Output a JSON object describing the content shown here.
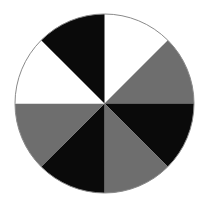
{
  "figure": {
    "background_color": "#ffffff",
    "canvas": {
      "width": 209,
      "height": 211
    }
  },
  "chart_data": {
    "type": "pie",
    "title": "",
    "subtitle": "",
    "xlabel": "",
    "ylabel": "",
    "grid": false,
    "legend_position": "none",
    "center": {
      "cx": 104.5,
      "cy": 103.5
    },
    "radius": 89.5,
    "outline_color": "#8a8a8a",
    "outline_width": 1,
    "start_angle_deg": 0,
    "direction": "clockwise",
    "slice_count": 8,
    "slice_angle_deg": 45,
    "categories": [
      "sector-1",
      "sector-2",
      "sector-3",
      "sector-4",
      "sector-5",
      "sector-6",
      "sector-7",
      "sector-8"
    ],
    "values": [
      45,
      45,
      45,
      45,
      45,
      45,
      45,
      45
    ],
    "colors": [
      "#ffffff",
      "#6e6e6e",
      "#0a0a0a",
      "#6e6e6e",
      "#0a0a0a",
      "#6e6e6e",
      "#ffffff",
      "#0a0a0a"
    ],
    "slices": [
      {
        "name": "sector-1",
        "start_deg": 0,
        "end_deg": 45,
        "value": 45,
        "color": "#ffffff",
        "clock_position": "12:00-1:30",
        "shade": "white"
      },
      {
        "name": "sector-2",
        "start_deg": 45,
        "end_deg": 90,
        "value": 45,
        "color": "#6e6e6e",
        "clock_position": "1:30-3:00",
        "shade": "gray"
      },
      {
        "name": "sector-3",
        "start_deg": 90,
        "end_deg": 135,
        "value": 45,
        "color": "#0a0a0a",
        "clock_position": "3:00-4:30",
        "shade": "black"
      },
      {
        "name": "sector-4",
        "start_deg": 135,
        "end_deg": 180,
        "value": 45,
        "color": "#6e6e6e",
        "clock_position": "4:30-6:00",
        "shade": "gray"
      },
      {
        "name": "sector-5",
        "start_deg": 180,
        "end_deg": 225,
        "value": 45,
        "color": "#0a0a0a",
        "clock_position": "6:00-7:30",
        "shade": "black"
      },
      {
        "name": "sector-6",
        "start_deg": 225,
        "end_deg": 270,
        "value": 45,
        "color": "#6e6e6e",
        "clock_position": "7:30-9:00",
        "shade": "gray"
      },
      {
        "name": "sector-7",
        "start_deg": 270,
        "end_deg": 315,
        "value": 45,
        "color": "#ffffff",
        "clock_position": "9:00-10:30",
        "shade": "white"
      },
      {
        "name": "sector-8",
        "start_deg": 315,
        "end_deg": 360,
        "value": 45,
        "color": "#0a0a0a",
        "clock_position": "10:30-12:00",
        "shade": "black"
      }
    ]
  }
}
